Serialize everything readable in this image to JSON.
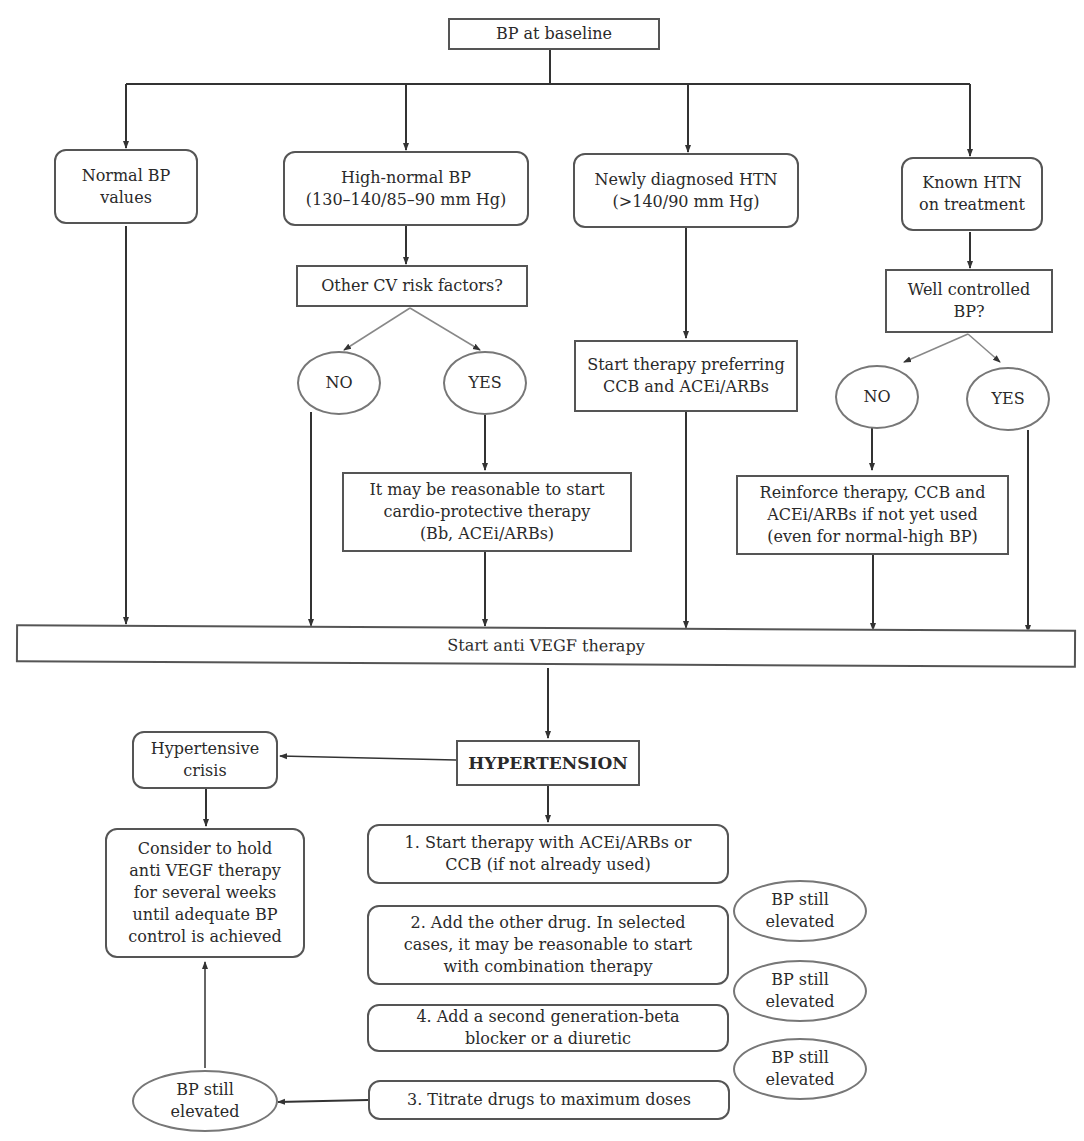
{
  "diagram": {
    "type": "flowchart",
    "topic": "Blood pressure management before and during anti VEGF therapy",
    "nodes": {
      "baseline": "BP at baseline",
      "normal_bp": "Normal BP\nvalues",
      "high_normal": "High-normal BP\n(130–140/85–90 mm Hg)",
      "newly_diagnosed": "Newly diagnosed HTN\n(>140/90 mm Hg)",
      "known_htn": "Known HTN\non treatment",
      "other_cv_risk": "Other CV risk factors?",
      "cv_no": "NO",
      "cv_yes": "YES",
      "start_therapy_ccb": "Start therapy preferring\nCCB and ACEi/ARBs",
      "well_controlled": "Well controlled\nBP?",
      "wc_no": "NO",
      "wc_yes": "YES",
      "cardio_protective": "It may be reasonable to start\ncardio-protective therapy\n(Bb, ACEi/ARBs)",
      "reinforce_therapy": "Reinforce therapy, CCB and\nACEi/ARBs if not yet used\n(even for normal-high BP)",
      "start_anti_vegf": "Start anti VEGF therapy",
      "hypertension": "HYPERTENSION",
      "hypertensive_crisis": "Hypertensive\ncrisis",
      "consider_hold": "Consider to hold\nanti VEGF therapy\nfor several weeks\nuntil adequate BP\ncontrol is achieved",
      "step1": "1. Start therapy with ACEi/ARBs or\nCCB (if not already used)",
      "step2": "2. Add the other drug. In selected\ncases, it may be reasonable to start\nwith combination therapy",
      "step4": "4. Add a second generation-beta\nblocker or a diuretic",
      "step3": "3. Titrate drugs to maximum doses",
      "still_elevated_1": "BP still\nelevated",
      "still_elevated_2": "BP still\nelevated",
      "still_elevated_3": "BP still\nelevated",
      "still_elevated_left": "BP still\nelevated"
    },
    "edges": [
      [
        "baseline",
        "normal_bp"
      ],
      [
        "baseline",
        "high_normal"
      ],
      [
        "baseline",
        "newly_diagnosed"
      ],
      [
        "baseline",
        "known_htn"
      ],
      [
        "high_normal",
        "other_cv_risk"
      ],
      [
        "other_cv_risk",
        "cv_no"
      ],
      [
        "other_cv_risk",
        "cv_yes"
      ],
      [
        "cv_yes",
        "cardio_protective"
      ],
      [
        "newly_diagnosed",
        "start_therapy_ccb"
      ],
      [
        "known_htn",
        "well_controlled"
      ],
      [
        "well_controlled",
        "wc_no"
      ],
      [
        "well_controlled",
        "wc_yes"
      ],
      [
        "wc_no",
        "reinforce_therapy"
      ],
      [
        "normal_bp",
        "start_anti_vegf"
      ],
      [
        "cv_no",
        "start_anti_vegf"
      ],
      [
        "cardio_protective",
        "start_anti_vegf"
      ],
      [
        "start_therapy_ccb",
        "start_anti_vegf"
      ],
      [
        "reinforce_therapy",
        "start_anti_vegf"
      ],
      [
        "wc_yes",
        "start_anti_vegf"
      ],
      [
        "start_anti_vegf",
        "hypertension"
      ],
      [
        "hypertension",
        "hypertensive_crisis"
      ],
      [
        "hypertension",
        "step1"
      ],
      [
        "hypertensive_crisis",
        "consider_hold"
      ],
      [
        "step3",
        "still_elevated_left"
      ],
      [
        "still_elevated_left",
        "consider_hold"
      ]
    ]
  }
}
